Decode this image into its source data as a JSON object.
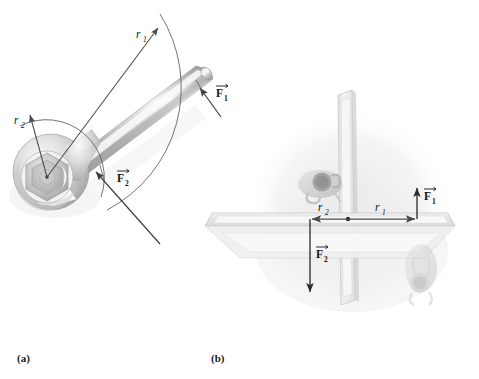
{
  "figure": {
    "type": "physics-torque-diagram",
    "background_color": "#ffffff",
    "panels": [
      {
        "id": "a",
        "caption": "(a)",
        "subject": "wrench-on-bolt",
        "description": "Open-end wrench gripping a hex bolt, with radius vectors and applied forces",
        "labels": [
          {
            "name": "r1",
            "text": "r",
            "sub": "1"
          },
          {
            "name": "r2",
            "text": "r",
            "sub": "2"
          },
          {
            "name": "F1",
            "text": "F",
            "sub": "1"
          },
          {
            "name": "F2",
            "text": "F",
            "sub": "2"
          }
        ]
      },
      {
        "id": "b",
        "caption": "(b)",
        "subject": "revolving-door-top-view",
        "description": "Revolving door seen from above with two people pushing on opposite panels",
        "labels": [
          {
            "name": "r1",
            "text": "r",
            "sub": "1"
          },
          {
            "name": "r2",
            "text": "r",
            "sub": "2"
          },
          {
            "name": "F1",
            "text": "F",
            "sub": "1"
          },
          {
            "name": "F2",
            "text": "F",
            "sub": "2"
          }
        ]
      }
    ],
    "colors": {
      "metal_dark": "#8f8f8f",
      "metal_mid": "#b9b9b9",
      "metal_light": "#e3e3e3",
      "metal_highlight": "#fbfbfb",
      "glass_panel": "#ececec",
      "panel_edge": "#c4c4c4",
      "arrow": "#4a4a4a",
      "arrow_dark": "#3c3c3c",
      "ink": "#141414",
      "shadow": "#e6e6e6"
    },
    "captions": {
      "a": "(a)",
      "b": "(b)"
    },
    "panel_a_labels": {
      "r1_letter": "r",
      "r1_sub": "1",
      "r2_letter": "r",
      "r2_sub": "2",
      "F1_letter": "F",
      "F1_sub": "1",
      "F2_letter": "F",
      "F2_sub": "2"
    },
    "panel_b_labels": {
      "r1_letter": "r",
      "r1_sub": "1",
      "r2_letter": "r",
      "r2_sub": "2",
      "F1_letter": "F",
      "F1_sub": "1",
      "F2_letter": "F",
      "F2_sub": "2"
    }
  }
}
